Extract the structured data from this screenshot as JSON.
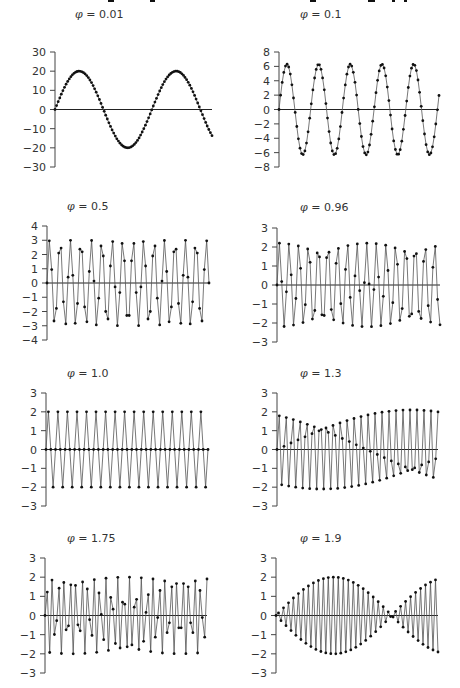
{
  "chart_data": [
    {
      "type": "line",
      "title": "φ = 0.01",
      "phi": 0.01,
      "ylim": [
        -30,
        30
      ],
      "yticks": [
        "30",
        "20",
        "10",
        "0",
        "−10",
        "−20",
        "−30"
      ],
      "tick_values": [
        30,
        20,
        10,
        0,
        -10,
        -20,
        -30
      ],
      "amplitude": 20,
      "cycles": 1.62,
      "points": 100,
      "markers": true,
      "grid": false
    },
    {
      "type": "line",
      "title": "φ = 0.1",
      "phi": 0.1,
      "ylim": [
        -8,
        8
      ],
      "yticks": [
        "8",
        "6",
        "4",
        "2",
        "0",
        "−2",
        "−4",
        "−6",
        "−8"
      ],
      "tick_values": [
        8,
        6,
        4,
        2,
        0,
        -2,
        -4,
        -6,
        -8
      ],
      "amplitude": 6.3,
      "cycles": 5.05,
      "points": 100,
      "markers": true,
      "grid": false
    },
    {
      "type": "line",
      "title": "φ = 0.5",
      "phi": 0.5,
      "ylim": [
        -4,
        4
      ],
      "yticks": [
        "4",
        "3",
        "2",
        "1",
        "0",
        "−1",
        "−2",
        "−3",
        "−4"
      ],
      "tick_values": [
        4,
        3,
        2,
        1,
        0,
        -1,
        -2,
        -3,
        -4
      ],
      "amplitude": 3,
      "cycles": 15.5,
      "points": 70,
      "markers": true,
      "grid": false
    },
    {
      "type": "line",
      "title": "φ = 0.96",
      "phi": 0.96,
      "ylim": [
        -3,
        3
      ],
      "yticks": [
        "3",
        "2",
        "1",
        "0",
        "−1",
        "−2",
        "−3"
      ],
      "tick_values": [
        3,
        2,
        1,
        0,
        -1,
        -2,
        -3
      ],
      "amplitude": 2.2,
      "cycles": 16.8,
      "points": 70,
      "markers": true,
      "grid": false
    },
    {
      "type": "line",
      "title": "φ = 1.0",
      "phi": 1.0,
      "ylim": [
        -3,
        3
      ],
      "yticks": [
        "3",
        "2",
        "1",
        "0",
        "−1",
        "−2",
        "−3"
      ],
      "tick_values": [
        3,
        2,
        1,
        0,
        -1,
        -2,
        -3
      ],
      "amplitude": 2,
      "cycles": 17,
      "points": 69,
      "markers": true,
      "grid": false
    },
    {
      "type": "line",
      "title": "φ = 1.3",
      "phi": 1.3,
      "ylim": [
        -3,
        3
      ],
      "yticks": [
        "3",
        "2",
        "1",
        "0",
        "−1",
        "−2",
        "−3"
      ],
      "tick_values": [
        3,
        2,
        1,
        0,
        -1,
        -2,
        -3
      ],
      "amplitude": 2.1,
      "cycles": 23.3,
      "points": 70,
      "markers": true,
      "grid": false
    },
    {
      "type": "line",
      "title": "φ = 1.75",
      "phi": 1.75,
      "ylim": [
        -3,
        3
      ],
      "yticks": [
        "3",
        "2",
        "1",
        "0",
        "−1",
        "−2",
        "−3"
      ],
      "tick_values": [
        3,
        2,
        1,
        0,
        -1,
        -2,
        -3
      ],
      "amplitude": 2,
      "cycles": 27.3,
      "points": 70,
      "markers": true,
      "grid": false
    },
    {
      "type": "line",
      "title": "φ = 1.9",
      "phi": 1.9,
      "ylim": [
        -3,
        3
      ],
      "yticks": [
        "3",
        "2",
        "1",
        "0",
        "−1",
        "−2",
        "−3"
      ],
      "tick_values": [
        3,
        2,
        1,
        0,
        -1,
        -2,
        -3
      ],
      "amplitude": 2,
      "cycles": 31.8,
      "points": 66,
      "markers": true,
      "grid": false
    }
  ],
  "panels": [
    {
      "title_prefix": "φ",
      "title_value": " = 0.01"
    },
    {
      "title_prefix": "φ",
      "title_value": " = 0.1"
    },
    {
      "title_prefix": "φ",
      "title_value": " = 0.5"
    },
    {
      "title_prefix": "φ",
      "title_value": " = 0.96"
    },
    {
      "title_prefix": "φ",
      "title_value": " = 1.0"
    },
    {
      "title_prefix": "φ",
      "title_value": " = 1.3"
    },
    {
      "title_prefix": "φ",
      "title_value": " = 1.75"
    },
    {
      "title_prefix": "φ",
      "title_value": " = 1.9"
    }
  ],
  "colors": {
    "line": "#555555",
    "marker": "#111111",
    "axis": "#444444",
    "zero_line": "#222222"
  }
}
